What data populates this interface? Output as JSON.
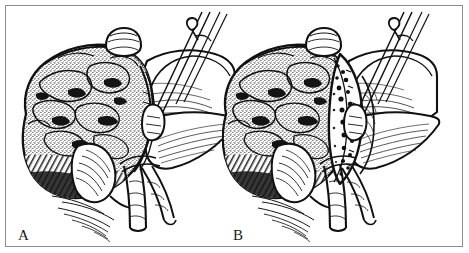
{
  "figure": {
    "kind": "medical-surgical-illustration",
    "style": "pen-and-ink stipple line drawing, black on white",
    "border_color": "#8d8d8d",
    "ink_color": "#111111",
    "paper_color": "#ffffff",
    "panel_count": 2
  },
  "panels": [
    {
      "label": "A",
      "caption_text": "A",
      "description": "Intact liver with gallbladder retracted, diaphragm held up by a clamp, portal structures exposed at the hilum",
      "structures": [
        "liver",
        "gallbladder",
        "falciform-ligament",
        "diaphragm",
        "portal-vein",
        "common-bile-duct",
        "hepatic-artery",
        "surgical-clamp"
      ]
    },
    {
      "label": "B",
      "caption_text": "B",
      "description": "Same view after incision: a dark stippled resection line runs along the liver edge exposing the cut surface",
      "structures": [
        "liver",
        "resection-line",
        "cut-surface",
        "gallbladder",
        "falciform-ligament",
        "diaphragm",
        "portal-vein",
        "common-bile-duct",
        "hepatic-artery",
        "surgical-clamp"
      ]
    }
  ]
}
